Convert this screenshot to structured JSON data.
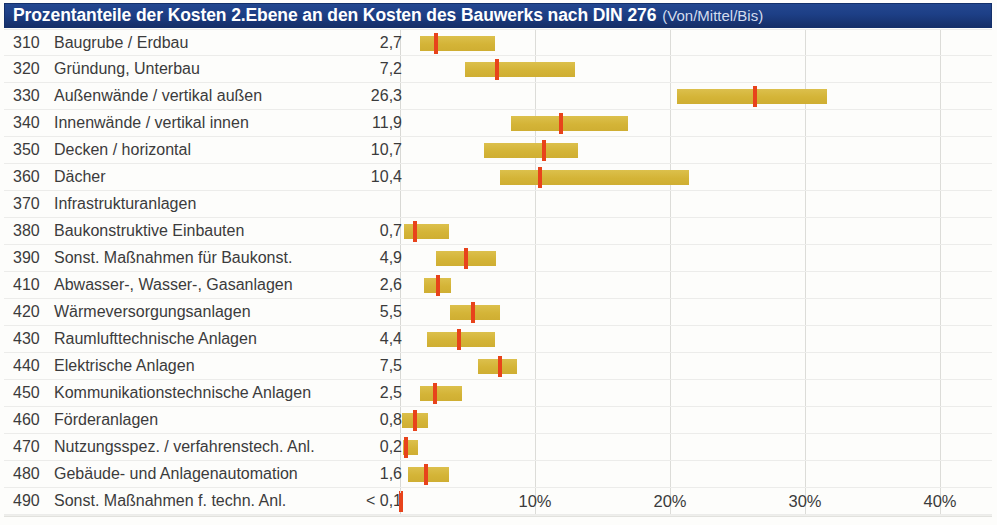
{
  "header": {
    "title": "Prozentanteile der Kosten 2.Ebene an den Kosten des Bauwerks nach DIN 276",
    "subtitle": "(Von/Mittel/Bis)",
    "bar_color": "#1b3f88",
    "text_color": "#ffffff"
  },
  "style": {
    "bar_color": "#d6b63e",
    "marker_color": "#e8431b",
    "gridline_color": "#dcdcd8",
    "row_separator_color": "#ececea"
  },
  "chart_data": {
    "type": "bar",
    "title": "Prozentanteile der Kosten 2.Ebene an den Kosten des Bauwerks nach DIN 276",
    "subtitle": "(Von/Mittel/Bis)",
    "xlabel": "",
    "ylabel": "",
    "xlim": [
      0,
      43.5
    ],
    "xticks": [
      10,
      20,
      30,
      40
    ],
    "xticklabels": [
      "10%",
      "20%",
      "30%",
      "40%"
    ],
    "grid": true,
    "legend": null,
    "value_column_header": "",
    "categories": [
      "310 Baugrube / Erdbau",
      "320 Gründung, Unterbau",
      "330 Außenwände / vertikal außen",
      "340 Innenwände / vertikal innen",
      "350 Decken / horizontal",
      "360 Dächer",
      "370 Infrastrukturanlagen",
      "380 Baukonstruktive Einbauten",
      "390 Sonst. Maßnahmen für Baukonst.",
      "410 Abwasser-, Wasser-, Gasanlagen",
      "420 Wärmeversorgungsanlagen",
      "430 Raumlufttechnische Anlagen",
      "440 Elektrische Anlagen",
      "450 Kommunikationstechnische Anlagen",
      "460 Förderanlagen",
      "470 Nutzungsspez. / verfahrenstech. Anl.",
      "480 Gebäude- und Anlagenautomation",
      "490 Sonst. Maßnahmen f. techn. Anl."
    ],
    "values": [
      2.7,
      7.2,
      26.3,
      11.9,
      10.7,
      10.4,
      null,
      0.7,
      4.9,
      2.6,
      5.5,
      4.4,
      7.5,
      2.5,
      0.8,
      0.2,
      1.6,
      0.1
    ],
    "ranges_from": [
      1.5,
      4.8,
      20.5,
      8.2,
      6.2,
      7.4,
      null,
      0.3,
      2.7,
      1.8,
      3.7,
      2.0,
      5.8,
      1.5,
      0.15,
      0.2,
      0.6,
      0.1
    ],
    "ranges_to": [
      7.0,
      13.0,
      31.6,
      16.9,
      13.2,
      21.4,
      null,
      3.6,
      7.1,
      3.8,
      7.4,
      7.0,
      8.7,
      4.6,
      2.1,
      1.3,
      3.6,
      0.1
    ]
  },
  "rows": [
    {
      "code": "310",
      "label": "Baugrube / Erdbau",
      "value": "2,7",
      "from": 1.5,
      "mid": 2.7,
      "to": 7.0
    },
    {
      "code": "320",
      "label": "Gründung, Unterbau",
      "value": "7,2",
      "from": 4.8,
      "mid": 7.2,
      "to": 13.0
    },
    {
      "code": "330",
      "label": "Außenwände / vertikal außen",
      "value": "26,3",
      "from": 20.5,
      "mid": 26.3,
      "to": 31.6
    },
    {
      "code": "340",
      "label": "Innenwände / vertikal innen",
      "value": "11,9",
      "from": 8.2,
      "mid": 11.9,
      "to": 16.9
    },
    {
      "code": "350",
      "label": "Decken / horizontal",
      "value": "10,7",
      "from": 6.2,
      "mid": 10.7,
      "to": 13.2
    },
    {
      "code": "360",
      "label": "Dächer",
      "value": "10,4",
      "from": 7.4,
      "mid": 10.4,
      "to": 21.4
    },
    {
      "code": "370",
      "label": "Infrastrukturanlagen",
      "value": "",
      "from": null,
      "mid": null,
      "to": null
    },
    {
      "code": "380",
      "label": "Baukonstruktive Einbauten",
      "value": "0,7",
      "from": 0.3,
      "mid": 1.1,
      "to": 3.6
    },
    {
      "code": "390",
      "label": "Sonst. Maßnahmen für Baukonst.",
      "value": "4,9",
      "from": 2.7,
      "mid": 4.9,
      "to": 7.1
    },
    {
      "code": "410",
      "label": "Abwasser-, Wasser-, Gasanlagen",
      "value": "2,6",
      "from": 1.8,
      "mid": 2.8,
      "to": 3.8
    },
    {
      "code": "420",
      "label": "Wärmeversorgungsanlagen",
      "value": "5,5",
      "from": 3.7,
      "mid": 5.4,
      "to": 7.4
    },
    {
      "code": "430",
      "label": "Raumlufttechnische Anlagen",
      "value": "4,4",
      "from": 2.0,
      "mid": 4.4,
      "to": 7.0
    },
    {
      "code": "440",
      "label": "Elektrische Anlagen",
      "value": "7,5",
      "from": 5.8,
      "mid": 7.4,
      "to": 8.7
    },
    {
      "code": "450",
      "label": "Kommunikationstechnische Anlagen",
      "value": "2,5",
      "from": 1.5,
      "mid": 2.6,
      "to": 4.6
    },
    {
      "code": "460",
      "label": "Förderanlagen",
      "value": "0,8",
      "from": 0.15,
      "mid": 1.1,
      "to": 2.1
    },
    {
      "code": "470",
      "label": "Nutzungsspez. / verfahrenstech. Anl.",
      "value": "0,2",
      "from": 0.2,
      "mid": 0.45,
      "to": 1.3
    },
    {
      "code": "480",
      "label": "Gebäude- und Anlagenautomation",
      "value": "1,6",
      "from": 0.6,
      "mid": 1.9,
      "to": 3.6
    },
    {
      "code": "490",
      "label": "Sonst. Maßnahmen f. techn. Anl.",
      "value": "< 0,1",
      "from": 0.1,
      "mid": 0.1,
      "to": 0.1
    }
  ],
  "axis": {
    "ticks": [
      "10%",
      "20%",
      "30%",
      "40%"
    ],
    "tick_values": [
      10,
      20,
      30,
      40
    ]
  }
}
